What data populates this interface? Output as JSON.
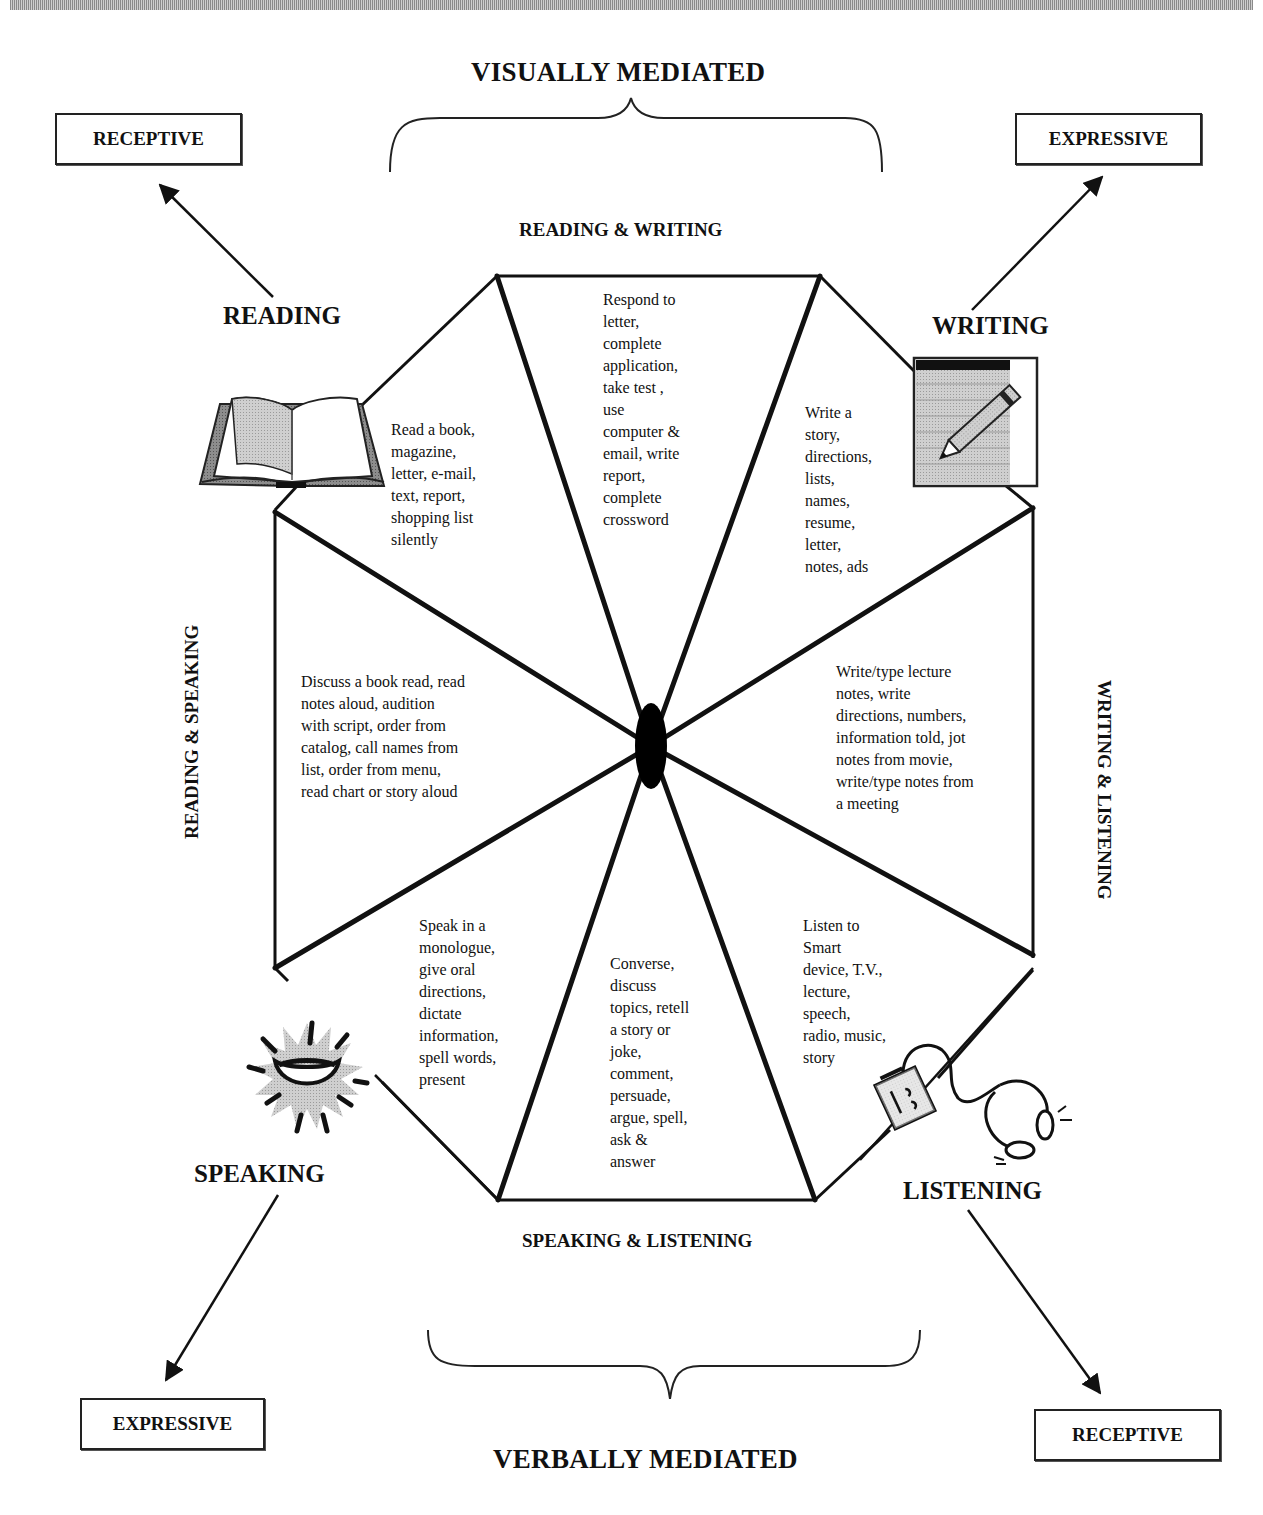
{
  "title_top": "VISUALLY MEDIATED",
  "title_bottom": "VERBALLY MEDIATED",
  "corner_boxes": {
    "top_left": "RECEPTIVE",
    "top_right": "EXPRESSIVE",
    "bottom_left": "EXPRESSIVE",
    "bottom_right": "RECEPTIVE"
  },
  "skills": {
    "reading": "READING",
    "writing": "WRITING",
    "speaking": "SPEAKING",
    "listening": "LISTENING"
  },
  "combinations": {
    "top": "READING & WRITING",
    "left": "READING & SPEAKING",
    "right": "WRITING & LISTENING",
    "bottom": "SPEAKING & LISTENING"
  },
  "segments": {
    "reading": "Read a book,\nmagazine,\nletter, e-mail,\ntext, report,\nshopping list\nsilently",
    "reading_writing": "Respond to\nletter,\ncomplete\napplication,\ntake test ,\nuse\ncomputer &\nemail, write\nreport,\ncomplete\ncrossword",
    "writing": "Write a\nstory,\ndirections,\nlists,\nnames,\nresume,\nletter,\nnotes, ads",
    "reading_speaking": "Discuss a book read, read\nnotes aloud, audition\nwith script, order from\ncatalog, call names from\nlist, order from menu,\nread chart or story aloud",
    "writing_listening": "Write/type lecture\nnotes, write\ndirections, numbers,\ninformation told, jot\nnotes from movie,\nwrite/type notes from\na meeting",
    "speaking": "Speak in a\nmonologue,\ngive oral\ndirections,\ndictate\ninformation,\nspell words,\npresent",
    "speaking_listening": "Converse,\ndiscuss\ntopics, retell\na story or\njoke,\ncomment,\npersuade,\nargue, spell,\nask &\nanswer",
    "listening": "Listen to\nSmart\ndevice, T.V.,\nlecture,\nspeech,\nradio, music,\nstory"
  },
  "icons": {
    "reading": "open-book",
    "writing": "notepad-pencil",
    "speaking": "shouting-mouth",
    "listening": "cassette-player-headphones"
  },
  "colors": {
    "line": "#111111",
    "icon_gray": "#b8b8b8",
    "background": "#ffffff"
  }
}
